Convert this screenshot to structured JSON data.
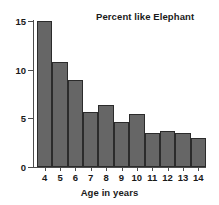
{
  "chart_data": {
    "type": "bar",
    "title": "Percent like Elephant",
    "xlabel": "Age in years",
    "ylabel": "",
    "categories": [
      "4",
      "5",
      "6",
      "7",
      "8",
      "9",
      "10",
      "11",
      "12",
      "13",
      "14"
    ],
    "values": [
      15.0,
      10.8,
      8.9,
      5.6,
      6.4,
      4.6,
      5.4,
      3.5,
      3.7,
      3.5,
      3.0
    ],
    "ylim": [
      0,
      15
    ],
    "yticks": [
      0,
      5,
      10,
      15
    ],
    "ytick_labels": [
      "0",
      "5",
      "10",
      "15"
    ],
    "grid": false,
    "legend": false,
    "bar_color": "#666666",
    "bar_edge_color": "#2b2b2b",
    "axis_color": "#4d4d4d",
    "text_color": "#1a1a1a",
    "background": "#ffffff",
    "title_position": "top-right"
  }
}
